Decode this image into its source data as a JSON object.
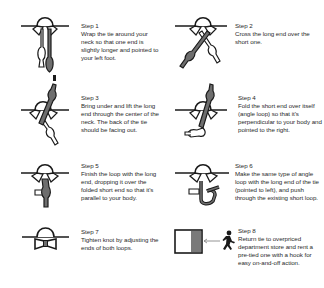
{
  "colors": {
    "ink": "#1a1a1a",
    "tie_fill": "#6e6e6e",
    "background": "#ffffff"
  },
  "steps": [
    {
      "number": 1,
      "label": "Step 1",
      "text": "Wrap the tie around your neck so that one end is slightly longer and pointed to your left foot.",
      "illustration": "tie-draped-around-neck"
    },
    {
      "number": 2,
      "label": "Step 2",
      "text": "Cross the long end over the short one.",
      "illustration": "tie-ends-crossed"
    },
    {
      "number": 3,
      "label": "Step 3",
      "text": "Bring under and lift the long end through the center of the neck. The back of the tie should be facing out.",
      "illustration": "long-end-lifted-through-neck"
    },
    {
      "number": 4,
      "label": "Step 4",
      "text": "Fold the short end over itself (angle loop) so that it's perpendicular to your body and pointed to the right.",
      "illustration": "short-end-folded-loop"
    },
    {
      "number": 5,
      "label": "Step 5",
      "text": "Finish the loop with the long end, dropping it over the folded short end so that it's parallel to your body.",
      "illustration": "long-end-dropped-over-loop"
    },
    {
      "number": 6,
      "label": "Step 6",
      "text": "Make the same type of angle loop with the long end of the tie (pointed to left), and push through the existing short loop.",
      "illustration": "second-loop-pushed-through"
    },
    {
      "number": 7,
      "label": "Step 7",
      "text": "Tighten knot by adjusting the ends of both loops.",
      "illustration": "finished-bow-tie"
    },
    {
      "number": 8,
      "label": "Step 8",
      "text": "Return tie to overpriced department store and rent a pre-tied one with a hook for easy on-and-off action.",
      "illustration": "person-running-to-exit-door"
    }
  ]
}
